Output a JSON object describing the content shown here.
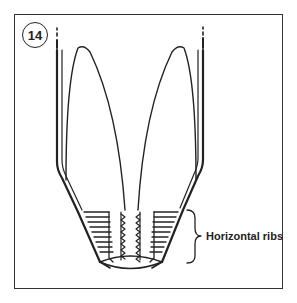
{
  "figure": {
    "number": "14",
    "annotation": "Horizontal ribs",
    "line_color": "#222222",
    "background": "#ffffff"
  }
}
